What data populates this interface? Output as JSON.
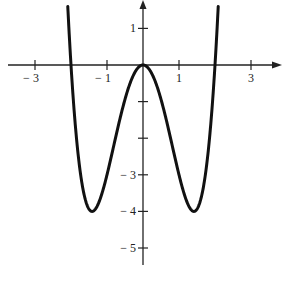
{
  "chart_data": {
    "type": "line",
    "title": "",
    "function": "y = x^4 - 4x^2",
    "xlabel": "",
    "ylabel": "",
    "x_ticks": [
      -3,
      -2,
      -1,
      1,
      2,
      3
    ],
    "x_tick_labels": [
      {
        "value": -3,
        "label": "− 3"
      },
      {
        "value": -1,
        "label": "− 1"
      },
      {
        "value": 1,
        "label": "1"
      },
      {
        "value": 3,
        "label": "3"
      }
    ],
    "y_ticks": [
      1,
      -1,
      -2,
      -3,
      -4,
      -5
    ],
    "y_tick_labels": [
      {
        "value": 1,
        "label": "1"
      },
      {
        "value": -3,
        "label": "− 3"
      },
      {
        "value": -4,
        "label": "− 4"
      },
      {
        "value": -5,
        "label": "− 5"
      }
    ],
    "xlim": [
      -3.4,
      3.7
    ],
    "ylim": [
      -5.2,
      1.7
    ],
    "grid": false,
    "key_points": [
      {
        "x": -2,
        "y": 0
      },
      {
        "x": -1.414,
        "y": -4
      },
      {
        "x": 0,
        "y": 0
      },
      {
        "x": 1.414,
        "y": -4
      },
      {
        "x": 2,
        "y": 0
      }
    ],
    "series": [
      {
        "name": "f(x)",
        "x": [
          -2.2,
          -2.1,
          -2.0,
          -1.9,
          -1.8,
          -1.7,
          -1.6,
          -1.5,
          -1.414,
          -1.3,
          -1.2,
          -1.1,
          -1.0,
          -0.9,
          -0.8,
          -0.7,
          -0.6,
          -0.5,
          -0.4,
          -0.3,
          -0.2,
          -0.1,
          0,
          0.1,
          0.2,
          0.3,
          0.4,
          0.5,
          0.6,
          0.7,
          0.8,
          0.9,
          1.0,
          1.1,
          1.2,
          1.3,
          1.414,
          1.5,
          1.6,
          1.7,
          1.8,
          1.9,
          2.0,
          2.1,
          2.2
        ],
        "values": [
          4.07,
          1.81,
          0,
          -1.41,
          -2.46,
          -3.21,
          -3.69,
          -3.94,
          -4.0,
          -3.9,
          -3.69,
          -3.38,
          -3.0,
          -2.58,
          -2.15,
          -1.72,
          -1.31,
          -0.94,
          -0.61,
          -0.35,
          -0.16,
          -0.04,
          0,
          -0.04,
          -0.16,
          -0.35,
          -0.61,
          -0.94,
          -1.31,
          -1.72,
          -2.15,
          -2.58,
          -3.0,
          -3.38,
          -3.69,
          -3.9,
          -4.0,
          -3.94,
          -3.69,
          -3.21,
          -2.46,
          -1.41,
          0,
          1.81,
          4.07
        ]
      }
    ]
  }
}
